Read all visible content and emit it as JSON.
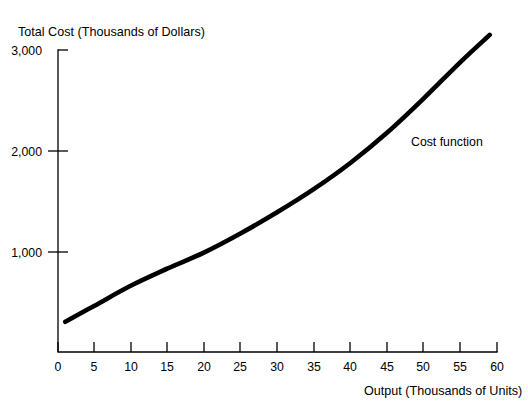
{
  "chart_data": {
    "type": "line",
    "title": "",
    "ylabel": "Total Cost (Thousands of Dollars)",
    "xlabel": "Output (Thousands of Units)",
    "xlim": [
      0,
      60
    ],
    "ylim": [
      0,
      3000
    ],
    "grid": false,
    "legend_position": "inline-annotation",
    "x_ticks": [
      0,
      5,
      10,
      15,
      20,
      25,
      30,
      35,
      40,
      45,
      50,
      55,
      60
    ],
    "x_tick_labels": [
      "0",
      "5",
      "10",
      "15",
      "20",
      "25",
      "30",
      "35",
      "40",
      "45",
      "50",
      "55",
      "60"
    ],
    "y_ticks": [
      1000,
      2000,
      3000
    ],
    "y_tick_labels": [
      "1,000",
      "2,000",
      "3,000"
    ],
    "annotations": [
      {
        "text": "Cost function",
        "x": 48,
        "y": 2100
      }
    ],
    "series": [
      {
        "name": "Cost function",
        "x": [
          1,
          5,
          10,
          15,
          20,
          25,
          30,
          35,
          40,
          45,
          50,
          55,
          59
        ],
        "values": [
          300,
          460,
          660,
          830,
          990,
          1180,
          1390,
          1620,
          1880,
          2180,
          2520,
          2880,
          3150
        ]
      }
    ]
  },
  "colors": {
    "curve": "#000000",
    "axis": "#000000",
    "text": "#000000",
    "background": "#ffffff"
  }
}
